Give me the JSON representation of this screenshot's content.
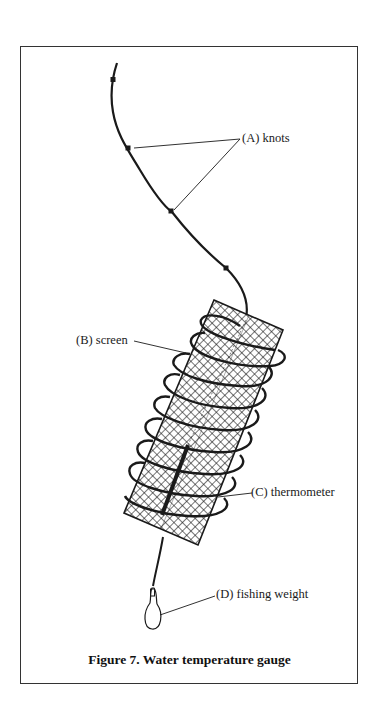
{
  "figure": {
    "caption": "Figure 7.  Water temperature gauge",
    "labels": {
      "knots": "(A)  knots",
      "screen": "(B)  screen",
      "thermometer": "(C)  thermometer",
      "weight": "(D)  fishing weight"
    },
    "parts": [
      {
        "id": "A",
        "name": "knots"
      },
      {
        "id": "B",
        "name": "screen"
      },
      {
        "id": "C",
        "name": "thermometer"
      },
      {
        "id": "D",
        "name": "fishing weight"
      }
    ],
    "colors": {
      "ink": "#1a1a1a",
      "background": "#ffffff"
    }
  }
}
